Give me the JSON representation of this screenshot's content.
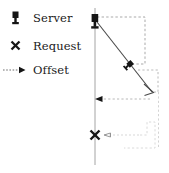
{
  "figure": {
    "type": "sequence-timeline-diagram",
    "background": "#ffffff",
    "stroke_dark": "#1a1a1a",
    "stroke_mid": "#8c8c8c",
    "stroke_light": "#c8c8c8",
    "stroke_faint": "#d8d8d8"
  },
  "legend": {
    "items": [
      {
        "icon": "server-icon",
        "label": "Server"
      },
      {
        "icon": "x-mark-icon",
        "label": "Request"
      },
      {
        "icon": "dashed-arrow-icon",
        "label": "Offset"
      }
    ]
  },
  "diagram": {
    "timeline_axis": {
      "name": "vertical-timeline-axis",
      "x": 95,
      "y_top": 8,
      "y_bottom": 165,
      "color": "#9a9a9a"
    },
    "servers": [
      {
        "name": "server-marker-top",
        "x": 95,
        "y": 24,
        "rotation": 0
      },
      {
        "name": "server-marker-diagonal",
        "x": 130,
        "y": 64,
        "rotation": 48
      }
    ],
    "request_marker": {
      "name": "x-mark-request",
      "x": 95,
      "y": 135
    },
    "diagonal_trajectory": {
      "name": "diagonal-path",
      "from_x": 97,
      "from_y": 22,
      "to_x": 152,
      "to_y": 92,
      "color": "#4a4a4a"
    },
    "offset_arrows": [
      {
        "name": "offset-arrow-middle",
        "from_x": 150,
        "from_y": 99,
        "to_x": 96,
        "to_y": 99,
        "direction": "left"
      },
      {
        "name": "offset-arrow-bottom",
        "from_x": 140,
        "from_y": 135,
        "to_x": 99,
        "to_y": 135,
        "direction": "left"
      }
    ],
    "dashed_guides": [
      {
        "name": "guide-top-box",
        "points": "97,17 145,17 145,64 130,64"
      },
      {
        "name": "guide-mid-step",
        "points": "139,70 158,70 158,92 152,92"
      },
      {
        "name": "guide-right-vertical",
        "points": "158,92 158,148"
      },
      {
        "name": "guide-bottom-step",
        "points": "99,135 152,135 152,122 160,122 160,148 120,148"
      }
    ],
    "arrowheads": [
      {
        "name": "arrowhead-diagonal-end",
        "x": 152,
        "y": 92,
        "style": "open-v"
      },
      {
        "name": "arrowhead-offset-middle",
        "x": 96,
        "y": 99,
        "style": "solid"
      },
      {
        "name": "arrowhead-offset-bottom",
        "x": 99,
        "y": 135,
        "style": "small-open"
      }
    ]
  }
}
